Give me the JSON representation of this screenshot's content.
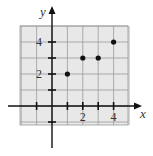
{
  "chart_data": {
    "type": "scatter",
    "title": "",
    "xlabel": "x",
    "ylabel": "y",
    "xlim": [
      -2,
      5
    ],
    "ylim": [
      -1.2,
      5
    ],
    "grid": true,
    "x_ticks": [
      -1,
      1,
      2,
      3,
      4
    ],
    "y_ticks": [
      -1,
      1,
      2,
      3,
      4
    ],
    "x_tick_labels": [
      "2",
      "4"
    ],
    "y_tick_labels": [
      "2",
      "4"
    ],
    "series": [
      {
        "name": "points",
        "x": [
          1,
          2,
          3,
          4
        ],
        "y": [
          2,
          3,
          3,
          4
        ]
      }
    ],
    "colors": {
      "grid_fill": "#e8e8e8",
      "grid_line": "#9a9a9a",
      "axis": "#111111",
      "point": "#111111"
    }
  }
}
